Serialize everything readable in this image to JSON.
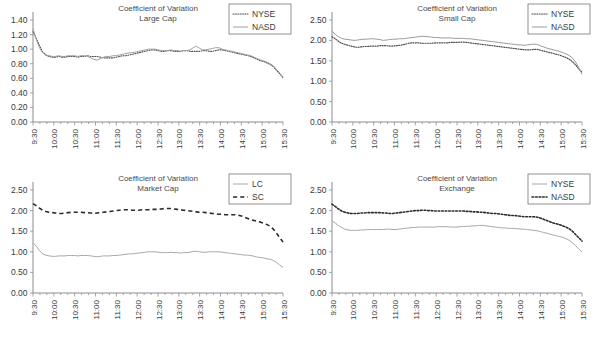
{
  "figure": {
    "panel_count": 4,
    "background": "#ffffff",
    "ink": "#3a3a3a"
  },
  "chart_data": [
    {
      "id": "large-cap",
      "type": "line",
      "title": "Coefficient of Variation",
      "subtitle": "Large Cap",
      "xlabel": "",
      "ylabel": "",
      "ylim": [
        0.0,
        1.4
      ],
      "yticks": [
        "0.00",
        "0.20",
        "0.40",
        "0.60",
        "0.80",
        "1.00",
        "1.20",
        "1.40"
      ],
      "grid": false,
      "legend_position": "top-right",
      "categories": [
        "9:30",
        "10:00",
        "10:30",
        "11:00",
        "11:30",
        "12:00",
        "12:30",
        "13:00",
        "13:30",
        "14:00",
        "14:30",
        "15:00",
        "15:30"
      ],
      "x": [
        0,
        1,
        2,
        3,
        4,
        5,
        6,
        7,
        8,
        9,
        10,
        11,
        12,
        13,
        14,
        15,
        16,
        17,
        18,
        19,
        20,
        21,
        22,
        23,
        24,
        25,
        26,
        27,
        28,
        29,
        30,
        31,
        32,
        33,
        34,
        35,
        36,
        37,
        38,
        39,
        40,
        41,
        42,
        43,
        44,
        45,
        46,
        47,
        48,
        49,
        50,
        51,
        52,
        53,
        54,
        55,
        56,
        57,
        58,
        59,
        60,
        61,
        62,
        63,
        64,
        65,
        66,
        67,
        68,
        69,
        70,
        71,
        72,
        73,
        74,
        75,
        76,
        77,
        78
      ],
      "series": [
        {
          "name": "NYSE",
          "style": "dotted",
          "color": "#4d4d4d",
          "width": 1.1,
          "values": [
            1.24,
            1.15,
            1.05,
            0.96,
            0.92,
            0.9,
            0.89,
            0.89,
            0.9,
            0.89,
            0.89,
            0.9,
            0.9,
            0.9,
            0.89,
            0.9,
            0.9,
            0.91,
            0.9,
            0.9,
            0.9,
            0.89,
            0.88,
            0.88,
            0.88,
            0.88,
            0.89,
            0.9,
            0.91,
            0.91,
            0.92,
            0.93,
            0.94,
            0.95,
            0.96,
            0.97,
            0.98,
            0.99,
            0.99,
            0.98,
            0.97,
            0.97,
            0.98,
            0.98,
            0.97,
            0.97,
            0.97,
            0.98,
            0.98,
            0.97,
            0.97,
            0.97,
            0.97,
            0.98,
            0.98,
            0.97,
            0.97,
            0.98,
            0.99,
            0.99,
            0.98,
            0.97,
            0.96,
            0.95,
            0.94,
            0.93,
            0.92,
            0.91,
            0.9,
            0.88,
            0.86,
            0.84,
            0.83,
            0.81,
            0.79,
            0.76,
            0.71,
            0.66,
            0.61
          ]
        },
        {
          "name": "NASD",
          "style": "solid",
          "color": "#a0a0a0",
          "width": 1.0,
          "values": [
            1.28,
            1.14,
            1.02,
            0.95,
            0.92,
            0.91,
            0.9,
            0.9,
            0.91,
            0.9,
            0.9,
            0.91,
            0.91,
            0.91,
            0.9,
            0.91,
            0.91,
            0.9,
            0.88,
            0.86,
            0.85,
            0.87,
            0.89,
            0.9,
            0.9,
            0.91,
            0.91,
            0.92,
            0.93,
            0.94,
            0.95,
            0.95,
            0.96,
            0.97,
            0.98,
            0.99,
            1.0,
            1.0,
            1.0,
            0.99,
            0.98,
            0.98,
            0.98,
            0.99,
            0.98,
            0.98,
            0.97,
            0.98,
            0.98,
            0.99,
            1.02,
            1.04,
            1.01,
            0.99,
            0.99,
            1.0,
            1.01,
            1.02,
            1.02,
            1.0,
            0.99,
            0.98,
            0.97,
            0.96,
            0.95,
            0.94,
            0.93,
            0.92,
            0.91,
            0.89,
            0.87,
            0.85,
            0.84,
            0.82,
            0.8,
            0.77,
            0.72,
            0.67,
            0.62
          ]
        }
      ]
    },
    {
      "id": "small-cap",
      "type": "line",
      "title": "Coefficient of Variation",
      "subtitle": "Small Cap",
      "xlabel": "",
      "ylabel": "",
      "ylim": [
        0.0,
        2.5
      ],
      "yticks": [
        "0.00",
        "0.50",
        "1.00",
        "1.50",
        "2.00",
        "2.50"
      ],
      "grid": false,
      "legend_position": "top-right",
      "categories": [
        "9:30",
        "10:00",
        "10:30",
        "11:00",
        "11:30",
        "12:00",
        "12:30",
        "13:00",
        "13:30",
        "14:00",
        "14:30",
        "15:00",
        "15:30"
      ],
      "x": [
        0,
        1,
        2,
        3,
        4,
        5,
        6,
        7,
        8,
        9,
        10,
        11,
        12,
        13,
        14,
        15,
        16,
        17,
        18,
        19,
        20,
        21,
        22,
        23,
        24,
        25,
        26,
        27,
        28,
        29,
        30,
        31,
        32,
        33,
        34,
        35,
        36,
        37,
        38,
        39,
        40,
        41,
        42,
        43,
        44,
        45,
        46,
        47,
        48,
        49,
        50,
        51,
        52,
        53,
        54,
        55,
        56,
        57,
        58,
        59,
        60,
        61,
        62,
        63,
        64,
        65,
        66,
        67,
        68,
        69,
        70,
        71,
        72,
        73,
        74,
        75,
        76,
        77,
        78
      ],
      "series": [
        {
          "name": "NYSE",
          "style": "dotted",
          "color": "#4d4d4d",
          "width": 1.2,
          "values": [
            2.09,
            2.04,
            1.98,
            1.93,
            1.9,
            1.88,
            1.86,
            1.84,
            1.83,
            1.84,
            1.85,
            1.85,
            1.86,
            1.86,
            1.86,
            1.87,
            1.87,
            1.87,
            1.86,
            1.86,
            1.87,
            1.88,
            1.89,
            1.91,
            1.93,
            1.94,
            1.94,
            1.94,
            1.93,
            1.93,
            1.93,
            1.93,
            1.94,
            1.94,
            1.94,
            1.94,
            1.94,
            1.95,
            1.95,
            1.95,
            1.96,
            1.96,
            1.95,
            1.94,
            1.93,
            1.92,
            1.91,
            1.9,
            1.89,
            1.88,
            1.87,
            1.86,
            1.85,
            1.84,
            1.83,
            1.82,
            1.81,
            1.8,
            1.79,
            1.78,
            1.77,
            1.77,
            1.77,
            1.78,
            1.78,
            1.76,
            1.74,
            1.72,
            1.7,
            1.68,
            1.66,
            1.64,
            1.61,
            1.58,
            1.54,
            1.48,
            1.4,
            1.3,
            1.22
          ]
        },
        {
          "name": "NASD",
          "style": "solid",
          "color": "#9a9a9a",
          "width": 1.0,
          "values": [
            2.23,
            2.15,
            2.09,
            2.05,
            2.03,
            2.02,
            2.01,
            2.0,
            2.01,
            2.02,
            2.03,
            2.03,
            2.04,
            2.04,
            2.03,
            2.02,
            2.0,
            2.01,
            2.02,
            2.03,
            2.03,
            2.04,
            2.04,
            2.05,
            2.06,
            2.07,
            2.08,
            2.09,
            2.1,
            2.1,
            2.09,
            2.08,
            2.07,
            2.07,
            2.06,
            2.06,
            2.06,
            2.06,
            2.05,
            2.05,
            2.05,
            2.05,
            2.04,
            2.04,
            2.03,
            2.02,
            2.01,
            2.0,
            1.99,
            1.98,
            1.97,
            1.96,
            1.95,
            1.94,
            1.93,
            1.92,
            1.91,
            1.9,
            1.89,
            1.89,
            1.88,
            1.89,
            1.9,
            1.91,
            1.9,
            1.87,
            1.84,
            1.81,
            1.79,
            1.77,
            1.75,
            1.73,
            1.7,
            1.67,
            1.63,
            1.57,
            1.47,
            1.33,
            1.17
          ]
        }
      ]
    },
    {
      "id": "market-cap",
      "type": "line",
      "title": "Coefficient of Variation",
      "subtitle": "Market Cap",
      "xlabel": "",
      "ylabel": "",
      "ylim": [
        0.0,
        2.5
      ],
      "yticks": [
        "0.00",
        "0.50",
        "1.00",
        "1.50",
        "2.00",
        "2.50"
      ],
      "grid": false,
      "legend_position": "top-right",
      "categories": [
        "9:30",
        "10:00",
        "10:30",
        "11:00",
        "11:30",
        "12:00",
        "12:30",
        "13:00",
        "13:30",
        "14:00",
        "14:30",
        "15:00",
        "15:30"
      ],
      "x": [
        0,
        1,
        2,
        3,
        4,
        5,
        6,
        7,
        8,
        9,
        10,
        11,
        12,
        13,
        14,
        15,
        16,
        17,
        18,
        19,
        20,
        21,
        22,
        23,
        24,
        25,
        26,
        27,
        28,
        29,
        30,
        31,
        32,
        33,
        34,
        35,
        36,
        37,
        38,
        39,
        40,
        41,
        42,
        43,
        44,
        45,
        46,
        47,
        48,
        49,
        50,
        51,
        52,
        53,
        54,
        55,
        56,
        57,
        58,
        59,
        60,
        61,
        62,
        63,
        64,
        65,
        66,
        67,
        68,
        69,
        70,
        71,
        72,
        73,
        74,
        75,
        76,
        77,
        78
      ],
      "series": [
        {
          "name": "LC",
          "style": "solid",
          "color": "#a8a8a8",
          "width": 1.0,
          "values": [
            1.22,
            1.14,
            1.03,
            0.95,
            0.92,
            0.9,
            0.89,
            0.89,
            0.9,
            0.9,
            0.9,
            0.91,
            0.91,
            0.91,
            0.9,
            0.91,
            0.91,
            0.91,
            0.9,
            0.89,
            0.88,
            0.89,
            0.9,
            0.9,
            0.9,
            0.91,
            0.91,
            0.92,
            0.93,
            0.94,
            0.95,
            0.95,
            0.96,
            0.97,
            0.98,
            0.99,
            1.0,
            1.0,
            1.0,
            0.99,
            0.98,
            0.98,
            0.98,
            0.99,
            0.98,
            0.98,
            0.97,
            0.98,
            0.98,
            0.99,
            1.01,
            1.01,
            1.0,
            0.99,
            0.99,
            1.0,
            1.0,
            1.0,
            1.0,
            0.99,
            0.98,
            0.97,
            0.96,
            0.95,
            0.94,
            0.93,
            0.92,
            0.92,
            0.91,
            0.89,
            0.87,
            0.86,
            0.85,
            0.83,
            0.82,
            0.79,
            0.74,
            0.68,
            0.62
          ]
        },
        {
          "name": "SC",
          "style": "dashed",
          "color": "#2b2b2b",
          "width": 1.6,
          "values": [
            2.17,
            2.12,
            2.06,
            2.01,
            1.98,
            1.96,
            1.95,
            1.94,
            1.93,
            1.93,
            1.94,
            1.95,
            1.96,
            1.96,
            1.96,
            1.96,
            1.95,
            1.95,
            1.94,
            1.93,
            1.94,
            1.95,
            1.96,
            1.97,
            1.98,
            1.99,
            2.0,
            2.01,
            2.02,
            2.02,
            2.02,
            2.01,
            2.01,
            2.01,
            2.02,
            2.02,
            2.02,
            2.03,
            2.03,
            2.03,
            2.04,
            2.05,
            2.05,
            2.05,
            2.04,
            2.03,
            2.02,
            2.01,
            2.0,
            1.99,
            1.98,
            1.97,
            1.96,
            1.96,
            1.95,
            1.94,
            1.93,
            1.92,
            1.91,
            1.91,
            1.9,
            1.9,
            1.9,
            1.9,
            1.89,
            1.87,
            1.84,
            1.81,
            1.78,
            1.76,
            1.74,
            1.72,
            1.69,
            1.66,
            1.62,
            1.55,
            1.45,
            1.34,
            1.24
          ]
        }
      ]
    },
    {
      "id": "exchange",
      "type": "line",
      "title": "Coefficient of Variation",
      "subtitle": "Exchange",
      "xlabel": "",
      "ylabel": "",
      "ylim": [
        0.0,
        2.5
      ],
      "yticks": [
        "0.00",
        "0.50",
        "1.00",
        "1.50",
        "2.00",
        "2.50"
      ],
      "grid": false,
      "legend_position": "top-right",
      "categories": [
        "9:30",
        "10:00",
        "10:30",
        "11:00",
        "11:30",
        "12:00",
        "12:30",
        "13:00",
        "13:30",
        "14:00",
        "14:30",
        "15:00",
        "15:30"
      ],
      "x": [
        0,
        1,
        2,
        3,
        4,
        5,
        6,
        7,
        8,
        9,
        10,
        11,
        12,
        13,
        14,
        15,
        16,
        17,
        18,
        19,
        20,
        21,
        22,
        23,
        24,
        25,
        26,
        27,
        28,
        29,
        30,
        31,
        32,
        33,
        34,
        35,
        36,
        37,
        38,
        39,
        40,
        41,
        42,
        43,
        44,
        45,
        46,
        47,
        48,
        49,
        50,
        51,
        52,
        53,
        54,
        55,
        56,
        57,
        58,
        59,
        60,
        61,
        62,
        63,
        64,
        65,
        66,
        67,
        68,
        69,
        70,
        71,
        72,
        73,
        74,
        75,
        76,
        77,
        78
      ],
      "series": [
        {
          "name": "NYSE",
          "style": "solid",
          "color": "#a8a8a8",
          "width": 1.0,
          "values": [
            1.75,
            1.7,
            1.64,
            1.59,
            1.55,
            1.53,
            1.52,
            1.52,
            1.52,
            1.53,
            1.53,
            1.54,
            1.54,
            1.54,
            1.54,
            1.54,
            1.54,
            1.55,
            1.55,
            1.54,
            1.54,
            1.55,
            1.56,
            1.57,
            1.58,
            1.59,
            1.59,
            1.6,
            1.6,
            1.6,
            1.6,
            1.6,
            1.6,
            1.61,
            1.61,
            1.61,
            1.61,
            1.6,
            1.6,
            1.6,
            1.61,
            1.61,
            1.62,
            1.62,
            1.63,
            1.63,
            1.64,
            1.64,
            1.63,
            1.62,
            1.61,
            1.6,
            1.59,
            1.58,
            1.58,
            1.57,
            1.57,
            1.56,
            1.56,
            1.55,
            1.55,
            1.54,
            1.53,
            1.52,
            1.51,
            1.49,
            1.47,
            1.45,
            1.43,
            1.41,
            1.39,
            1.37,
            1.35,
            1.32,
            1.28,
            1.22,
            1.15,
            1.07,
            0.99
          ]
        },
        {
          "name": "NASD",
          "style": "dotted",
          "color": "#2b2b2b",
          "width": 1.6,
          "values": [
            2.16,
            2.1,
            2.04,
            1.99,
            1.96,
            1.94,
            1.93,
            1.93,
            1.93,
            1.94,
            1.94,
            1.95,
            1.95,
            1.95,
            1.95,
            1.95,
            1.94,
            1.94,
            1.93,
            1.93,
            1.94,
            1.95,
            1.96,
            1.97,
            1.98,
            1.99,
            2.0,
            2.0,
            2.01,
            2.01,
            2.0,
            2.0,
            1.99,
            1.99,
            1.99,
            1.99,
            1.99,
            1.99,
            1.99,
            1.99,
            1.99,
            1.99,
            1.98,
            1.98,
            1.97,
            1.97,
            1.96,
            1.96,
            1.95,
            1.94,
            1.93,
            1.93,
            1.92,
            1.91,
            1.9,
            1.89,
            1.88,
            1.88,
            1.87,
            1.86,
            1.85,
            1.85,
            1.85,
            1.85,
            1.84,
            1.82,
            1.79,
            1.76,
            1.73,
            1.7,
            1.68,
            1.66,
            1.63,
            1.6,
            1.56,
            1.5,
            1.42,
            1.34,
            1.26
          ]
        }
      ]
    }
  ]
}
